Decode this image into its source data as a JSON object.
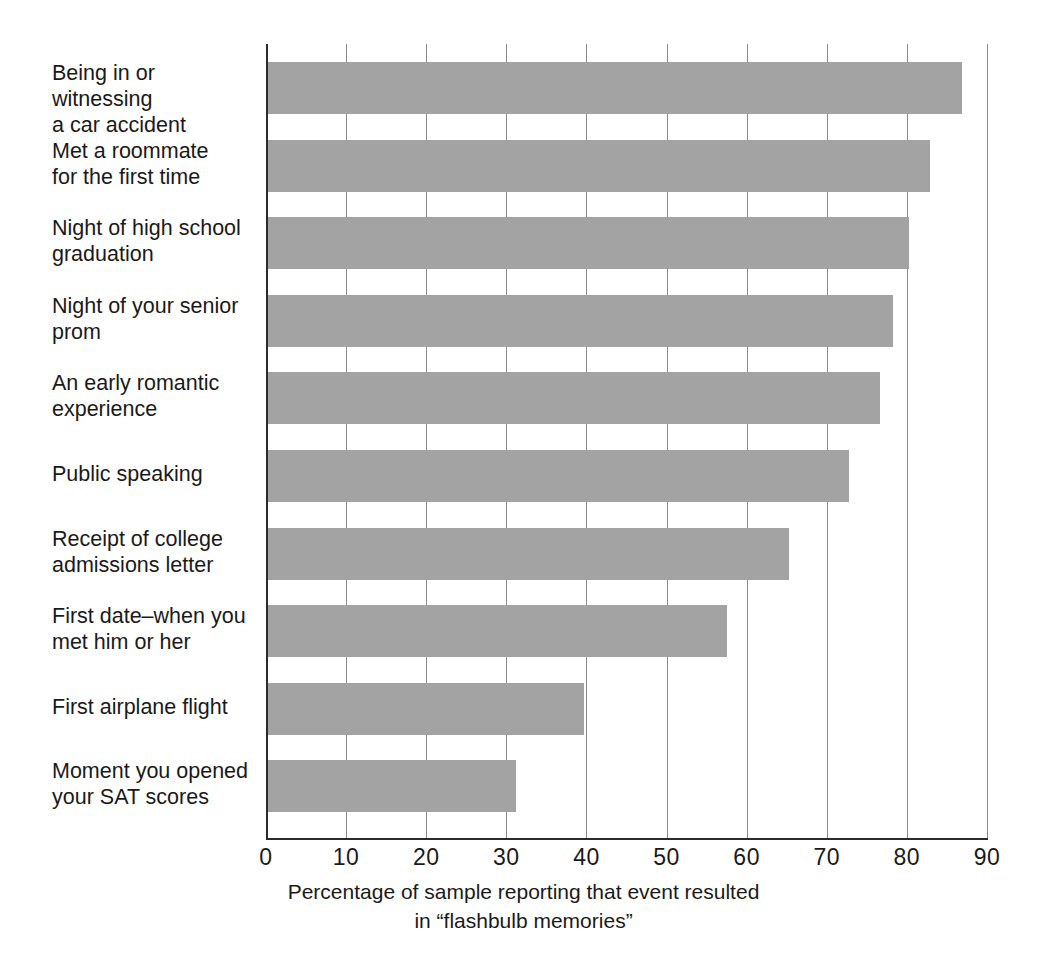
{
  "chart_data": {
    "type": "bar",
    "orientation": "horizontal",
    "title": "",
    "xlabel": "Percentage of sample reporting that event resulted in “flashbulb memories”",
    "ylabel": "",
    "xlim": [
      0,
      90
    ],
    "xticks": [
      0,
      10,
      20,
      30,
      40,
      50,
      60,
      70,
      80,
      90
    ],
    "xtick_labels": [
      "0",
      "10",
      "20",
      "30",
      "40",
      "50",
      "60",
      "70",
      "80",
      "90"
    ],
    "grid": "vertical",
    "legend": "none",
    "bar_color": "#a3a3a3",
    "axis_color": "#2b2b2b",
    "gridline_color": "#8c8c8c",
    "categories": [
      "Being in or witnessing\na car accident",
      "Met a roommate\nfor the first time",
      "Night of high school\ngraduation",
      "Night of your senior\nprom",
      "An early romantic\nexperience",
      "Public speaking",
      "Receipt of college\nadmissions letter",
      "First date–when you\nmet him or her",
      "First airplane flight",
      "Moment you opened\nyour SAT scores"
    ],
    "values": [
      86.6,
      82.6,
      80,
      78,
      76.4,
      72.5,
      65,
      57.3,
      39.5,
      31
    ]
  },
  "caption": {
    "line1": "Percentage of sample reporting that event resulted",
    "line2": "in “flashbulb memories”"
  }
}
